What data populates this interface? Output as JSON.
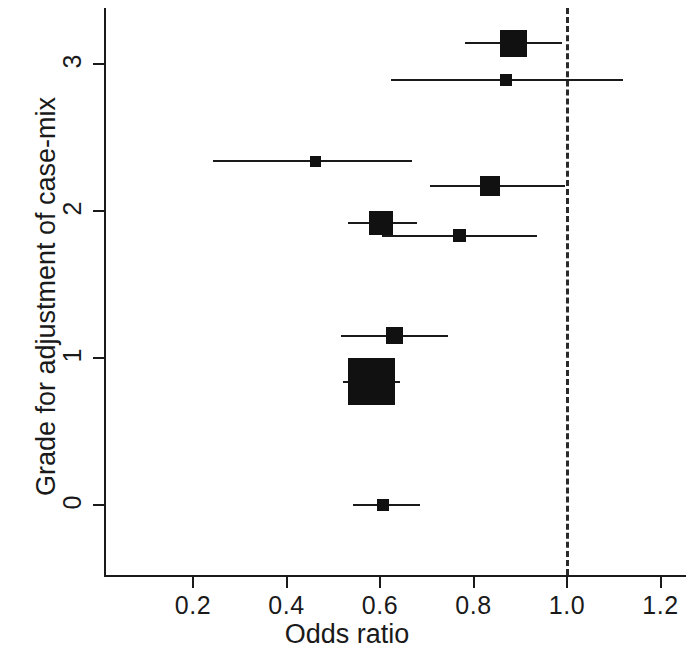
{
  "chart_data": {
    "type": "scatter",
    "subtype": "forest-plot",
    "title": "",
    "xlabel": "Odds ratio",
    "ylabel": "Grade for adjustment of case-mix",
    "xlim": [
      0.082,
      1.327
    ],
    "ylim": [
      -0.4,
      3.4
    ],
    "grid": false,
    "legend": null,
    "xticks": [
      0.2,
      0.4,
      0.6,
      0.8,
      1.0,
      1.2
    ],
    "xtick_labels": [
      "0.2",
      "0.4",
      "0.6",
      "0.8",
      "1.0",
      "1.2"
    ],
    "yticks": [
      0,
      1,
      2,
      3
    ],
    "ytick_labels": [
      "0",
      "1",
      "2",
      "3"
    ],
    "reference_line": {
      "x": 1.0,
      "style": "dashed",
      "color": "#2a2a2a"
    },
    "marker_style": "filled-square-weighted",
    "points": [
      {
        "id": "study-1",
        "grade": 3.14,
        "odds_ratio": 0.886,
        "ci_low": 0.782,
        "ci_high": 0.989,
        "weight_box_px": 27
      },
      {
        "id": "study-2",
        "grade": 2.89,
        "odds_ratio": 0.869,
        "ci_low": 0.623,
        "ci_high": 1.12,
        "weight_box_px": 12
      },
      {
        "id": "study-3",
        "grade": 2.34,
        "odds_ratio": 0.461,
        "ci_low": 0.243,
        "ci_high": 0.669,
        "weight_box_px": 11
      },
      {
        "id": "study-4",
        "grade": 2.17,
        "odds_ratio": 0.835,
        "ci_low": 0.707,
        "ci_high": 0.996,
        "weight_box_px": 20
      },
      {
        "id": "study-5",
        "grade": 1.92,
        "odds_ratio": 0.602,
        "ci_low": 0.532,
        "ci_high": 0.679,
        "weight_box_px": 24
      },
      {
        "id": "study-6",
        "grade": 1.83,
        "odds_ratio": 0.771,
        "ci_low": 0.604,
        "ci_high": 0.936,
        "weight_box_px": 13
      },
      {
        "id": "study-7",
        "grade": 1.15,
        "odds_ratio": 0.632,
        "ci_low": 0.517,
        "ci_high": 0.745,
        "weight_box_px": 17
      },
      {
        "id": "study-8",
        "grade": 0.84,
        "odds_ratio": 0.581,
        "ci_low": 0.521,
        "ci_high": 0.643,
        "weight_box_px": 47
      },
      {
        "id": "study-9",
        "grade": 0.0,
        "odds_ratio": 0.606,
        "ci_low": 0.542,
        "ci_high": 0.686,
        "weight_box_px": 12
      }
    ]
  },
  "axes": {
    "x_title": "Odds ratio",
    "y_title": "Grade for adjustment of case-mix"
  }
}
